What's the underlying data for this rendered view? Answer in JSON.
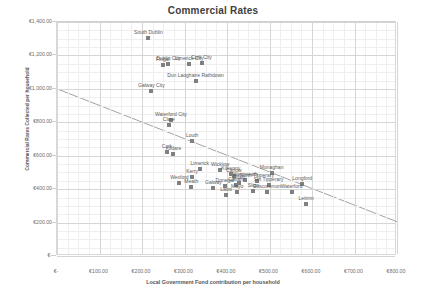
{
  "chart_data": {
    "type": "scatter",
    "title": "Commercial Rates",
    "xlabel": "Local Government Fund contribution per household",
    "ylabel": "Commercial Rates Collected per household",
    "xlim": [
      0,
      800
    ],
    "ylim": [
      0,
      1400
    ],
    "xticks": [
      "€-",
      "€100.00",
      "€200.00",
      "€300.00",
      "€400.00",
      "€500.00",
      "€600.00",
      "€700.00",
      "€800.00"
    ],
    "xtick_values": [
      0,
      100,
      200,
      300,
      400,
      500,
      600,
      700,
      800
    ],
    "yticks": [
      "€-",
      "€200.00",
      "€400.00",
      "€600.00",
      "€800.00",
      "€1,000.00",
      "€1,200.00",
      "€1,400.00"
    ],
    "ytick_values": [
      0,
      200,
      400,
      600,
      800,
      1000,
      1200,
      1400
    ],
    "grid": true,
    "legend": "none",
    "marker_color": "#808080",
    "trendline": {
      "label": "linear trend",
      "x0": 0,
      "y0": 1000,
      "x1": 800,
      "y1": 205,
      "color": "#8c8c8c"
    },
    "points": [
      {
        "label": "South Dublin",
        "x": 215,
        "y": 1305
      },
      {
        "label": "Dublin City",
        "x": 262,
        "y": 1148
      },
      {
        "label": "Fingal",
        "x": 249,
        "y": 1140
      },
      {
        "label": "Limerick City",
        "x": 311,
        "y": 1148
      },
      {
        "label": "Cork City",
        "x": 340,
        "y": 1152
      },
      {
        "label": "Dun Laoghaire Rathdown",
        "x": 326,
        "y": 1047
      },
      {
        "label": "Galway City",
        "x": 222,
        "y": 985
      },
      {
        "label": "Waterford City",
        "x": 268,
        "y": 812
      },
      {
        "label": "Clare",
        "x": 263,
        "y": 782
      },
      {
        "label": "Louth",
        "x": 318,
        "y": 688
      },
      {
        "label": "Cork",
        "x": 259,
        "y": 622
      },
      {
        "label": "Kildare",
        "x": 274,
        "y": 612
      },
      {
        "label": "Limerick",
        "x": 336,
        "y": 520
      },
      {
        "label": "Wicklow",
        "x": 384,
        "y": 512
      },
      {
        "label": "Kilkenny",
        "x": 409,
        "y": 492
      },
      {
        "label": "Carlow",
        "x": 416,
        "y": 477
      },
      {
        "label": "Monaghan",
        "x": 505,
        "y": 497
      },
      {
        "label": "Kerry",
        "x": 318,
        "y": 470
      },
      {
        "label": "Wexford",
        "x": 288,
        "y": 435
      },
      {
        "label": "Westmeath",
        "x": 443,
        "y": 455
      },
      {
        "label": "North Tipperary",
        "x": 470,
        "y": 448
      },
      {
        "label": "Offaly",
        "x": 428,
        "y": 437
      },
      {
        "label": "Meath",
        "x": 316,
        "y": 415
      },
      {
        "label": "Donegal",
        "x": 395,
        "y": 420
      },
      {
        "label": "Cavan",
        "x": 420,
        "y": 424
      },
      {
        "label": "Sth Tipperary",
        "x": 498,
        "y": 424
      },
      {
        "label": "Longford",
        "x": 577,
        "y": 430
      },
      {
        "label": "Galway",
        "x": 368,
        "y": 404
      },
      {
        "label": "Sligo",
        "x": 462,
        "y": 390
      },
      {
        "label": "Roscommon",
        "x": 494,
        "y": 382
      },
      {
        "label": "Waterford",
        "x": 552,
        "y": 382
      },
      {
        "label": "Mayo",
        "x": 424,
        "y": 380
      },
      {
        "label": "Laois",
        "x": 398,
        "y": 362
      },
      {
        "label": "Leitrim",
        "x": 586,
        "y": 313
      }
    ]
  }
}
